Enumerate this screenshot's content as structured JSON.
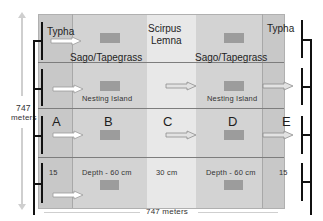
{
  "diagram": {
    "vertical_dimension": {
      "value": "747",
      "unit": "meters"
    },
    "horizontal_dimension": {
      "label": "747 meters"
    },
    "zones": [
      {
        "id": "A",
        "label": "A",
        "depth": "15"
      },
      {
        "id": "B",
        "label": "B",
        "depth": "Depth - 60 cm"
      },
      {
        "id": "C",
        "label": "C",
        "depth": "30 cm"
      },
      {
        "id": "D",
        "label": "D",
        "depth": "Depth - 60 cm"
      },
      {
        "id": "E",
        "label": "E",
        "depth": "15"
      }
    ],
    "vegetation": {
      "left_edge": "Typha",
      "right_edge": "Typha",
      "center_line1": "Scirpus",
      "center_line2": "Lemna",
      "left_band": "Sago/Tapegrass",
      "right_band": "Sago/Tapegrass"
    },
    "features": {
      "nesting_island_left": "Nesting Island",
      "nesting_island_right": "Nesting Island"
    },
    "colors": {
      "outer_zone": "#c8c8c8",
      "mid_zone": "#d4d4d4",
      "center_zone": "#e8e8e8",
      "island": "#9c9c9c",
      "bracket": "#111111",
      "row_divider": "#7d7d7d",
      "dimension_arrow": "#cfcfcf"
    }
  }
}
